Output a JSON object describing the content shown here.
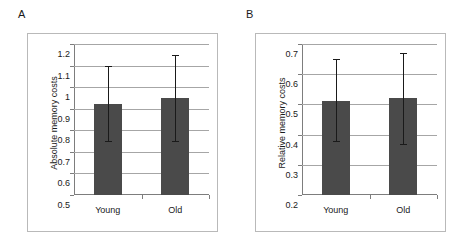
{
  "figure": {
    "background": "#ffffff",
    "bar_color": "#4a4a4a",
    "gridline_color": "#a6a6a6",
    "axis_color": "#7a7a7a",
    "frame_color": "#b9b9b9",
    "error_color": "#1a1a1a"
  },
  "panels": [
    {
      "letter": "A",
      "chart_data": {
        "type": "bar",
        "title": "",
        "xlabel": "",
        "ylabel": "Absolute memory costs",
        "categories": [
          "Young",
          "Old"
        ],
        "values": [
          0.92,
          0.95
        ],
        "error_low": [
          0.75,
          0.75
        ],
        "error_high": [
          1.1,
          1.15
        ],
        "ylim": [
          0.5,
          1.2
        ],
        "ytick_labels": [
          "0.5",
          "0.6",
          "0.7",
          "0.8",
          "0.9",
          "1",
          "1.1",
          "1.2"
        ],
        "ytick_values": [
          0.5,
          0.6,
          0.7,
          0.8,
          0.9,
          1.0,
          1.1,
          1.2
        ],
        "grid": true,
        "legend": "none"
      }
    },
    {
      "letter": "B",
      "chart_data": {
        "type": "bar",
        "title": "",
        "xlabel": "",
        "ylabel": "Relative memory costs",
        "categories": [
          "Young",
          "Old"
        ],
        "values": [
          0.51,
          0.52
        ],
        "error_low": [
          0.38,
          0.37
        ],
        "error_high": [
          0.65,
          0.67
        ],
        "ylim": [
          0.2,
          0.7
        ],
        "ytick_labels": [
          "0.2",
          "0.3",
          "0.4",
          "0.5",
          "0.6",
          "0.7"
        ],
        "ytick_values": [
          0.2,
          0.3,
          0.4,
          0.5,
          0.6,
          0.7
        ],
        "grid": true,
        "legend": "none"
      }
    }
  ]
}
